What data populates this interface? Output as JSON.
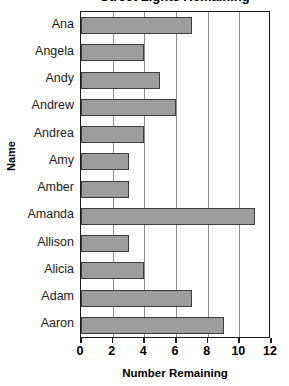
{
  "chart_data": {
    "type": "bar",
    "orientation": "horizontal",
    "title": "Street Lights Remaining",
    "xlabel": "Number Remaining",
    "ylabel": "Name",
    "categories": [
      "Ana",
      "Angela",
      "Andy",
      "Andrew",
      "Andrea",
      "Amy",
      "Amber",
      "Amanda",
      "Allison",
      "Alicia",
      "Adam",
      "Aaron"
    ],
    "values": [
      7,
      4,
      5,
      6,
      4,
      3,
      3,
      11,
      3,
      4,
      7,
      9
    ],
    "xlim": [
      0,
      12
    ],
    "xticks": [
      0,
      2,
      4,
      6,
      8,
      10,
      12
    ],
    "xtick_labels": [
      "0",
      "2",
      "4",
      "6",
      "8",
      "10",
      "12"
    ],
    "grid": "vertical",
    "legend": null,
    "bar_color": "#9d9d9d",
    "bar_edge_color": "#3d3d3d",
    "axis_color": "#1a1a1a",
    "gridline_color": "#8c8c8c",
    "background": "#ffffff"
  }
}
